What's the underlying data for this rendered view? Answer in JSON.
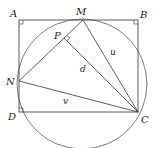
{
  "diagram": {
    "type": "geometry",
    "stroke_color": "#333333",
    "circle_color": "#555555",
    "points": {
      "A": {
        "label": "A",
        "x": 19,
        "y": 20
      },
      "B": {
        "label": "B",
        "x": 138,
        "y": 20
      },
      "C": {
        "label": "C",
        "x": 138,
        "y": 112
      },
      "D": {
        "label": "D",
        "x": 19,
        "y": 112
      },
      "M": {
        "label": "M",
        "x": 83,
        "y": 20
      },
      "N": {
        "label": "N",
        "x": 19,
        "y": 81
      },
      "P": {
        "label": "P",
        "x": 64,
        "y": 38
      }
    },
    "segment_labels": {
      "u": "u",
      "d": "d",
      "v": "v"
    },
    "circle": {
      "cx": 82,
      "cy": 84,
      "r": 65
    }
  }
}
